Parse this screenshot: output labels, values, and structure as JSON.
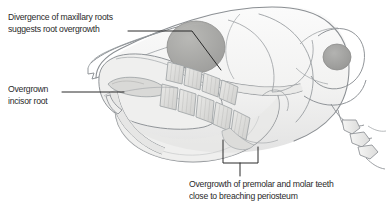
{
  "figure": {
    "background_color": "#ffffff"
  },
  "annotations": [
    {
      "id": "maxillary-root-divergence",
      "line1": "Divergence of maxillary roots",
      "line2": "suggests root overgrowth",
      "leader": "horizontal-then-diagonal-to-orbit"
    },
    {
      "id": "overgrown-incisor-root",
      "line1": "Overgrown",
      "line2": "incisor root",
      "leader": "horizontal-to-incisor-root"
    },
    {
      "id": "premolar-molar-overgrowth",
      "line1": "Overgrowth of premolar and molar teeth",
      "line2": "close to breaching periosteum",
      "leader": "bracket-to-cheek-teeth"
    }
  ],
  "illustration": {
    "type": "anatomical-line-drawing",
    "parts": [
      "cranium",
      "nasal-bone",
      "orbit",
      "zygomatic-arch",
      "maxilla",
      "mandible",
      "incisor",
      "premolar-molar-arcade",
      "tympanic-bulla",
      "occipital",
      "cervical-vertebrae"
    ],
    "palette": {
      "outline": "#8b8f93",
      "outline_dark": "#6f7478",
      "fill_light": "#f3f3f2",
      "fill_mid": "#e2e2e1",
      "fill_shadow": "#cfd0cf",
      "orbit_fill": "#a9a9a7",
      "tooth_fill": "#dcdcda",
      "tooth_stripe": "#c2c2c0",
      "leader_line": "#2a2a2a",
      "text": "#2a2a2a"
    }
  }
}
